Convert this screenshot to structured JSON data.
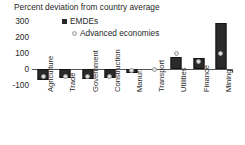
{
  "chart_data": {
    "type": "bar",
    "title": "Percent deviation from country average",
    "xlabel": "",
    "ylabel": "",
    "ylim": [
      -100,
      300
    ],
    "yticks": [
      300,
      200,
      100,
      0,
      -100
    ],
    "ytick_labels": [
      "300",
      "200",
      "100",
      "0",
      "-100"
    ],
    "grid": false,
    "legend_position": "top-center",
    "categories": [
      "Agriculture",
      "Trade",
      "Government",
      "Construction",
      "Manuf.",
      "Transport",
      "Utilities",
      "Finance",
      "Mining"
    ],
    "series": [
      {
        "name": "EMDEs",
        "marker": "bar",
        "color": "#2a2a2a",
        "values": [
          -70,
          -58,
          -60,
          -57,
          -22,
          0,
          75,
          70,
          290
        ]
      },
      {
        "name": "Advanced economies",
        "marker": "dot",
        "color": "#e2e2e2",
        "values": [
          -48,
          -45,
          -47,
          -45,
          -12,
          0,
          95,
          45,
          95
        ]
      }
    ]
  },
  "legend": {
    "items": [
      {
        "label": "EMDEs",
        "icon": "filled-square-marker"
      },
      {
        "label": "Advanced economies",
        "icon": "open-circle-marker"
      }
    ]
  },
  "colors": {
    "emde_bar": "#2a2a2a",
    "advanced_dot": "#e2e2e2",
    "axis": "#555555",
    "text": "#1f1f1f",
    "background": "#ffffff"
  }
}
